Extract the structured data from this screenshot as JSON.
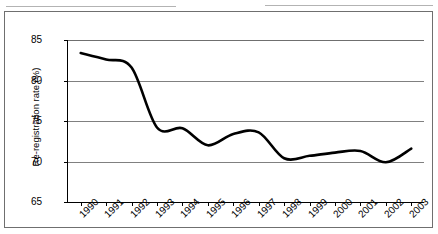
{
  "chart_data": {
    "type": "line",
    "title": "",
    "xlabel": "",
    "ylabel": "Re-registration rate (%)",
    "categories": [
      "1990",
      "1991",
      "1992",
      "1993",
      "1994",
      "1995",
      "1996",
      "1997",
      "1998",
      "1999",
      "2000",
      "2001",
      "2002",
      "2003"
    ],
    "values": [
      83.4,
      82.6,
      81.6,
      74.2,
      74.1,
      72.0,
      73.4,
      73.6,
      70.4,
      70.7,
      71.1,
      71.3,
      69.9,
      71.6
    ],
    "series": [
      {
        "name": "Re-registration rate",
        "values": [
          83.4,
          82.6,
          81.6,
          74.2,
          74.1,
          72.0,
          73.4,
          73.6,
          70.4,
          70.7,
          71.1,
          71.3,
          69.9,
          71.6
        ],
        "color": "#000000"
      }
    ],
    "ylim": [
      65,
      85
    ],
    "ytick_labels": [
      "85",
      "80",
      "75",
      "70",
      "65"
    ],
    "ytick_values": [
      85,
      80,
      75,
      70,
      65
    ],
    "grid": true,
    "legend": "none",
    "line_style": "smooth"
  },
  "axis": {
    "y_title": "Re-registration rate (%)",
    "y_ticks": [
      "85",
      "80",
      "75",
      "70",
      "65"
    ],
    "x_ticks": [
      "1990",
      "1991",
      "1992",
      "1993",
      "1994",
      "1995",
      "1996",
      "1997",
      "1998",
      "1999",
      "2000",
      "2001",
      "2002",
      "2003"
    ]
  },
  "colors": {
    "series_line": "#000000",
    "gridline": "#808080",
    "axis": "#000000",
    "frame": "#6f6f6f",
    "background": "#ffffff"
  }
}
